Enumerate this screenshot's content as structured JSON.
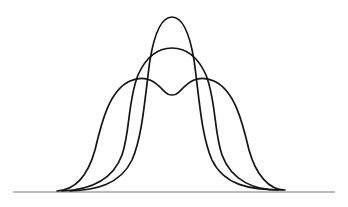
{
  "diagram": {
    "colors": {
      "background": "#ffffff",
      "curve_stroke": "#151515",
      "baseline_stroke": "#7a7a7a"
    },
    "baseline": {
      "x1": 13,
      "x2": 335,
      "y": 192
    },
    "curves": [
      {
        "name": "tall-narrow-unimodal",
        "peak": {
          "x": 172,
          "y": 17
        },
        "path": "M70,191 C95,190 120,185 132,160 C143,135 145,95 150,60 C155,30 162,17 172,17 C182,17 189,30 194,60 C199,95 201,135 212,160 C224,185 249,190 283,190"
      },
      {
        "name": "medium-unimodal",
        "peak": {
          "x": 172,
          "y": 48
        },
        "path": "M62,191 C88,190 112,182 122,155 C130,132 128,100 138,75 C147,55 160,48 172,48 C184,48 197,55 206,75 C216,100 214,132 222,155 C232,182 256,190 278,190"
      },
      {
        "name": "wide-bimodal",
        "peaks": [
          {
            "x": 140,
            "y": 79
          },
          {
            "x": 205,
            "y": 79
          }
        ],
        "dip": {
          "x": 172,
          "y": 95
        },
        "path": "M57,191 C75,190 88,175 95,150 C102,120 110,90 130,81 C148,73 158,85 165,92 C169,96 175,96 179,92 C186,85 196,73 214,81 C234,90 242,120 249,150 C256,175 269,190 285,190"
      }
    ]
  }
}
